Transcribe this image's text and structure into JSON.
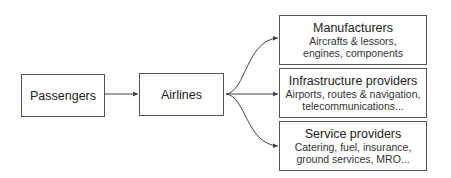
{
  "nodes": {
    "passengers": {
      "title": "Passengers"
    },
    "airlines": {
      "title": "Airlines"
    },
    "manufacturers": {
      "title": "Manufacturers",
      "line1": "Aircrafts & lessors,",
      "line2": "engines, components"
    },
    "infrastructure": {
      "title": "Infrastructure providers",
      "line1": "Airports, routes & navigation,",
      "line2": "telecommunications..."
    },
    "service": {
      "title": "Service providers",
      "line1": "Catering, fuel, insurance,",
      "line2": "ground services, MRO..."
    }
  },
  "edges": [
    {
      "from": "passengers",
      "to": "airlines"
    },
    {
      "from": "airlines",
      "to": "manufacturers"
    },
    {
      "from": "airlines",
      "to": "infrastructure"
    },
    {
      "from": "airlines",
      "to": "service"
    }
  ],
  "colors": {
    "line": "#444444",
    "border": "#555555",
    "text": "#222222"
  }
}
